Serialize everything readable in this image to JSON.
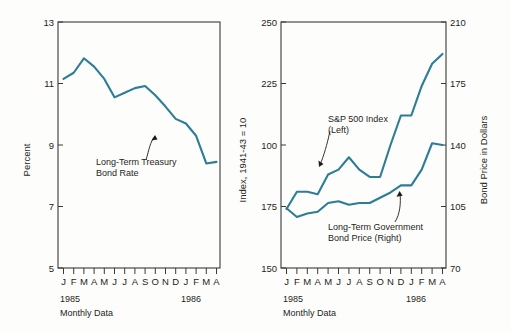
{
  "figure": {
    "background": "#fdfdfb",
    "line_color": "#2c7d95",
    "axis_color": "#3a3a3a"
  },
  "panels": [
    {
      "id": "left-panel",
      "name": "treasury-bond-rate-panel",
      "ylabel_left": "Percent",
      "ylabel_right": "Index, 1941-43 = 10",
      "year_start": "1985",
      "year_end": "1986",
      "caption": "Monthly Data",
      "annotation": {
        "line1": "Long-Term Treasury",
        "line2": "Bond Rate"
      }
    },
    {
      "id": "right-panel",
      "name": "sp500-and-bond-price-panel",
      "ylabel_right": "Bond Price in Dollars",
      "year_start": "1985",
      "year_end": "1986",
      "caption": "Monthly Data",
      "annotation_sp": {
        "line1": "S&P 500 Index",
        "line2": "(Left)"
      },
      "annotation_bond": {
        "line1": "Long-Term Government",
        "line2": "Bond Price (Right)"
      }
    }
  ],
  "chart_data": [
    {
      "type": "line",
      "id": "treasury-bond-rate",
      "title": "",
      "xlabel": "Monthly Data",
      "ylabel": "Percent",
      "ylabel_secondary": "Index, 1941-43 = 10",
      "grid": false,
      "legend": "annotation-callout",
      "ylim": [
        5,
        13
      ],
      "yticks": [
        5,
        7,
        9,
        11,
        13
      ],
      "categories": [
        "J",
        "F",
        "M",
        "A",
        "M",
        "J",
        "J",
        "A",
        "S",
        "O",
        "N",
        "D",
        "J",
        "F",
        "M",
        "A"
      ],
      "year_markers": [
        {
          "label": "1985",
          "index": 0
        },
        {
          "label": "1986",
          "index": 12
        }
      ],
      "series": [
        {
          "name": "Long-Term Treasury Bond Rate",
          "color": "#2c7d95",
          "values": [
            11.15,
            11.35,
            11.82,
            11.55,
            11.15,
            10.55,
            10.7,
            10.85,
            10.92,
            10.62,
            10.25,
            9.85,
            9.7,
            9.3,
            8.4,
            8.45
          ]
        }
      ]
    },
    {
      "type": "line",
      "id": "sp500-and-bond-price",
      "title": "",
      "xlabel": "Monthly Data",
      "ylabel": "Index, 1941-43 = 10",
      "ylabel_secondary": "Bond Price in Dollars",
      "grid": false,
      "legend": "annotation-callout",
      "ylim_left": [
        150,
        250
      ],
      "yticks_left": [
        150,
        175,
        100,
        225,
        250
      ],
      "ytick_labels_left": [
        "150",
        "175",
        "100",
        "225",
        "250"
      ],
      "ylim_right": [
        70,
        210
      ],
      "yticks_right": [
        70,
        105,
        140,
        175,
        210
      ],
      "categories": [
        "J",
        "F",
        "M",
        "A",
        "M",
        "J",
        "J",
        "A",
        "S",
        "O",
        "N",
        "D",
        "J",
        "F",
        "M",
        "A"
      ],
      "year_markers": [
        {
          "label": "1985",
          "index": 0
        },
        {
          "label": "1986",
          "index": 12
        }
      ],
      "series": [
        {
          "name": "S&P 500 Index (Left)",
          "axis": "left",
          "color": "#2c7d95",
          "values": [
            174,
            181,
            181,
            180,
            188,
            190,
            195,
            190,
            187,
            187,
            200,
            212,
            212,
            224,
            233,
            237
          ]
        },
        {
          "name": "Long-Term Government Bond Price (Right)",
          "axis": "right",
          "color": "#2c7d95",
          "values": [
            104,
            99,
            101,
            102,
            107,
            108,
            106,
            107,
            107,
            110,
            113,
            117,
            117,
            126,
            141,
            140
          ]
        }
      ]
    }
  ]
}
